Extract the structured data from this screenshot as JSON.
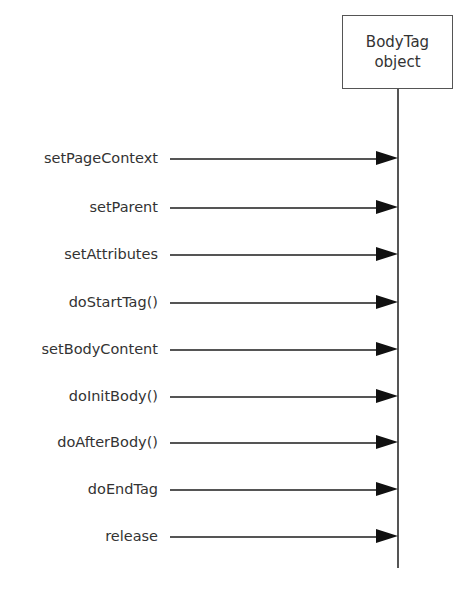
{
  "object": {
    "line1": "BodyTag",
    "line2": "object"
  },
  "messages": [
    {
      "label": "setPageContext",
      "y": 148
    },
    {
      "label": "setParent",
      "y": 197
    },
    {
      "label": "setAttributes",
      "y": 244
    },
    {
      "label": "doStartTag()",
      "y": 292
    },
    {
      "label": "setBodyContent",
      "y": 339
    },
    {
      "label": "doInitBody()",
      "y": 386
    },
    {
      "label": "doAfterBody()",
      "y": 432
    },
    {
      "label": "doEndTag",
      "y": 479
    },
    {
      "label": "release",
      "y": 526
    }
  ],
  "colors": {
    "line": "#555555",
    "arrowhead": "#111111",
    "text": "#333333"
  }
}
